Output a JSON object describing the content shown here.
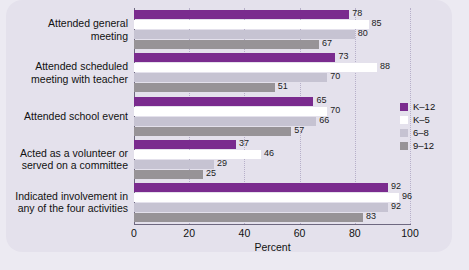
{
  "chart_data": {
    "type": "bar",
    "orientation": "horizontal",
    "title": "",
    "xlabel": "Percent",
    "ylabel": "",
    "xlim": [
      0,
      100
    ],
    "xticks": [
      0,
      20,
      40,
      60,
      80,
      100
    ],
    "grid": "vertical-dotted",
    "legend_position": "right",
    "categories": [
      "Attended general meeting",
      "Attended scheduled meeting with teacher",
      "Attended school event",
      "Acted as a volunteer or served on a committee",
      "Indicated involvement in any of the four activities"
    ],
    "series": [
      {
        "name": "K–12",
        "values": [
          78,
          73,
          65,
          37,
          92
        ]
      },
      {
        "name": "K–5",
        "values": [
          85,
          88,
          70,
          46,
          96
        ]
      },
      {
        "name": "6–8",
        "values": [
          80,
          70,
          66,
          29,
          92
        ]
      },
      {
        "name": "9–12",
        "values": [
          67,
          51,
          57,
          25,
          83
        ]
      }
    ]
  },
  "category_lines": [
    [
      "Attended general",
      "meeting"
    ],
    [
      "Attended scheduled",
      "meeting with teacher"
    ],
    [
      "Attended school event"
    ],
    [
      "Acted as a volunteer or",
      "served on a committee"
    ],
    [
      "Indicated involvement in",
      "any of the four activities"
    ]
  ],
  "colors": {
    "series": [
      "#7a2b8e",
      "#ffffff",
      "#c6c3d2",
      "#979397"
    ],
    "panel": "#e4e1ec",
    "page": "#eceaf2",
    "axis": "#6e6880",
    "grid": "#a79fbe",
    "text": "#111111"
  }
}
